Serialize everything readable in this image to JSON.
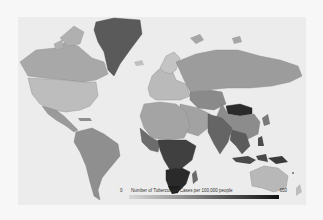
{
  "map": {
    "type": "choropleth",
    "projection": "mercator",
    "subject": "Tuberculosis incidence by country",
    "colors": {
      "ocean": "#ececec",
      "low": "#d8d8d8",
      "mid": "#9e9e9e",
      "high": "#555555",
      "very_high": "#1e1e1e"
    },
    "highlighted_regions": [
      {
        "name": "Greenland",
        "shade": "dark"
      },
      {
        "name": "Mongolia",
        "shade": "very dark"
      },
      {
        "name": "Sub-Saharan Africa",
        "shade": "dark"
      },
      {
        "name": "Southern Africa",
        "shade": "very dark"
      },
      {
        "name": "Indonesia / Papua",
        "shade": "dark"
      },
      {
        "name": "India",
        "shade": "medium-dark"
      }
    ]
  },
  "legend": {
    "min_label": "0",
    "title": "Number of Tuberculosis Cases per 100,000 people",
    "max_label": "650",
    "scale_min": 0,
    "scale_max": 650
  }
}
